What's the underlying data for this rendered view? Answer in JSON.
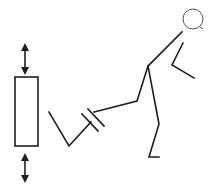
{
  "diagram": {
    "description": "Line drawing of a stick figure kicking toward a vertical rectangular block with up/down arrows",
    "colors": {
      "stroke": "#1e1e1e",
      "head": "#555555",
      "background": "#ffffff"
    },
    "figure": {
      "head": {
        "cx": 193,
        "cy": 19,
        "r": 10
      },
      "torso": "182,32 148,66",
      "arm": "183,43 172,65 194,78",
      "kicking_leg_upper": "148,66 137,101 94,112",
      "kicking_leg_lower": "90,125 69,146 49,112",
      "standing_leg": "148,66 159,124 149,157 159,157"
    },
    "block": {
      "x": 15,
      "y": 77,
      "width": 23,
      "height": 69
    },
    "arrows": {
      "top": {
        "x": 25,
        "y1": 45,
        "y2": 73
      },
      "bottom": {
        "x": 25,
        "y1": 155,
        "y2": 181
      }
    },
    "labels": {
      "figure": "kicking figure",
      "block": "block",
      "arrow_top": "up-down arrow top",
      "arrow_bottom": "up-down arrow bottom"
    }
  }
}
